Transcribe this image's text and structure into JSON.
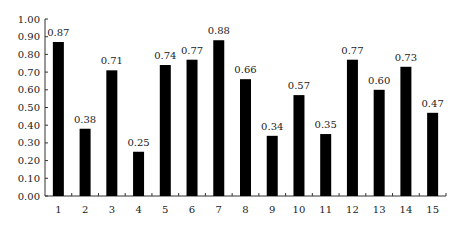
{
  "chart_data": {
    "type": "bar",
    "title": "",
    "xlabel": "",
    "ylabel": "",
    "categories": [
      "1",
      "2",
      "3",
      "4",
      "5",
      "6",
      "7",
      "8",
      "9",
      "10",
      "11",
      "12",
      "13",
      "14",
      "15"
    ],
    "values": [
      0.87,
      0.38,
      0.71,
      0.25,
      0.74,
      0.77,
      0.88,
      0.66,
      0.34,
      0.57,
      0.35,
      0.77,
      0.6,
      0.73,
      0.47
    ],
    "data_labels": [
      "0.87",
      "0.38",
      "0.71",
      "0.25",
      "0.74",
      "0.77",
      "0.88",
      "0.66",
      "0.34",
      "0.57",
      "0.35",
      "0.77",
      "0.60",
      "0.73",
      "0.47"
    ],
    "ylim": [
      0,
      1.0
    ],
    "yticks": [
      "0.00",
      "0.10",
      "0.20",
      "0.30",
      "0.40",
      "0.50",
      "0.60",
      "0.70",
      "0.80",
      "0.90",
      "1.00"
    ],
    "grid": false,
    "legend": null,
    "bar_color": "#000000",
    "axis_color": "#333333"
  }
}
